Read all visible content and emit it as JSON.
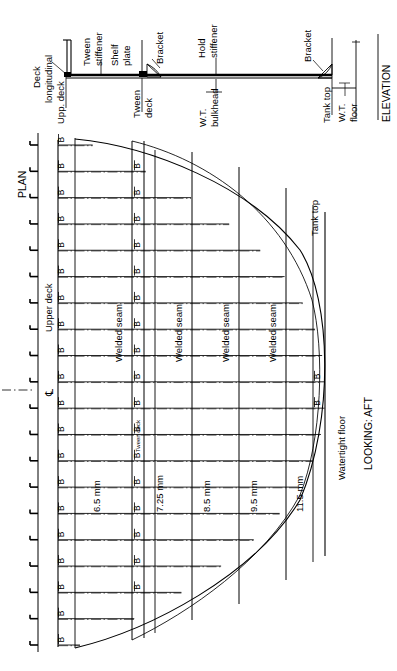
{
  "drawing": {
    "title": "Deck plating arrangement - elevation and plan",
    "views": {
      "elevation": {
        "caption": "ELEVATION",
        "labels": {
          "deck_longitudinal": "Deck\nlongitudinal",
          "upper_deck": "Upp. deck",
          "tween_stiffener": "Tween\nstiffener",
          "shelf_plate": "Shelf\nplate",
          "bracket_1": "Bracket",
          "tween_deck": "Tween\ndeck",
          "hold_stiffener": "Hold\nstiffener",
          "wt_bulkhead": "W.T.\nbulkhead",
          "bracket_2": "Bracket",
          "tank_top": "Tank top",
          "wt_floor": "W.T.\nfloor"
        }
      },
      "plan": {
        "caption": "PLAN",
        "view_direction": "LOOKING: AFT",
        "labels": {
          "upper_deck": "Upper deck",
          "tween_deck": "Tween deck",
          "tank_top": "Tank top",
          "watertight_floor": "Watertight floor",
          "centerline": "℄"
        },
        "seam_label": "Welded seam",
        "seam_count": 4,
        "plate_marker": "B",
        "frame_tick_count": 20,
        "plate_thicknesses": [
          {
            "value": "6.5 mm",
            "strake": 1
          },
          {
            "value": "7.25 mm",
            "strake": 2
          },
          {
            "value": "8.5 mm",
            "strake": 3
          },
          {
            "value": "9.5 mm",
            "strake": 4
          },
          {
            "value": "11.5 mm",
            "strake": 5
          }
        ]
      }
    },
    "colors": {
      "line": "#000000",
      "thin": "#1a1a1a",
      "background": "#ffffff"
    }
  },
  "chart_data": {
    "type": "table",
    "categories": [
      "Strake 1",
      "Strake 2",
      "Strake 3",
      "Strake 4",
      "Strake 5"
    ],
    "values": [
      6.5,
      7.25,
      8.5,
      9.5,
      11.5
    ],
    "ylabel": "Plate thickness (mm)",
    "xlabel": "Strake (inboard to outboard)",
    "tick_labels": [
      "6.5 mm",
      "7.25 mm",
      "8.5 mm",
      "9.5 mm",
      "11.5 mm"
    ],
    "legend": [
      "Welded seam",
      "B = butt"
    ],
    "grid": true
  }
}
